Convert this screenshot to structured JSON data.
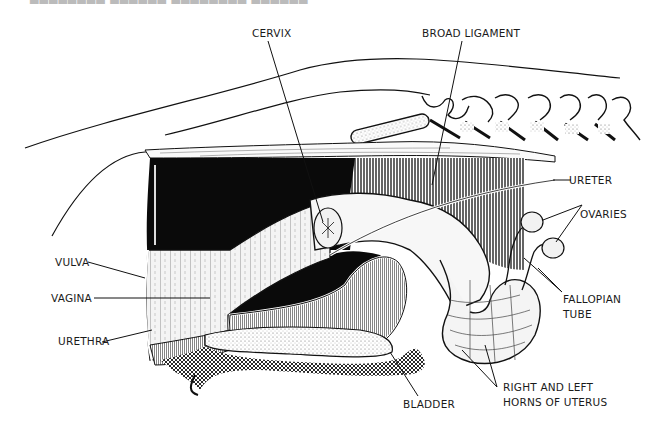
{
  "figure": {
    "type": "anatomical-illustration",
    "top_cropped_text": "████████ ██████ ████████ ██████"
  },
  "labels": {
    "cervix": "CERVIX",
    "broad_ligament": "BROAD LIGAMENT",
    "ureter": "URETER",
    "ovaries": "OVARIES",
    "vulva": "VULVA",
    "vagina": "VAGINA",
    "urethra": "URETHRA",
    "fallopian_tube_line1": "FALLOPIAN",
    "fallopian_tube_line2": "TUBE",
    "bladder": "BLADDER",
    "horns_line1": "RIGHT AND LEFT",
    "horns_line2": "HORNS OF UTERUS"
  },
  "colors": {
    "ink": "#111111",
    "paper": "#ffffff",
    "shade": "#d9d9d9"
  }
}
